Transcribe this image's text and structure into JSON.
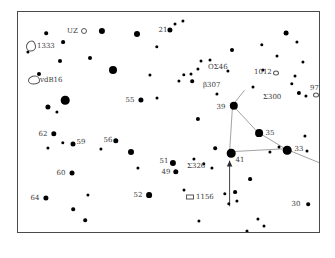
{
  "chart_data": {
    "type": "scatter",
    "title": "",
    "subtitle": "",
    "xlabel": "",
    "ylabel": "",
    "grid": false,
    "legend": "none",
    "field": {
      "x": 17,
      "y": 11,
      "width": 303,
      "height": 222
    },
    "xlim": [
      0,
      303
    ],
    "ylim": [
      0,
      222
    ],
    "stars": [
      {
        "x": 10,
        "y": 40,
        "r": 1.6
      },
      {
        "x": 28,
        "y": 21,
        "r": 1.8
      },
      {
        "x": 45,
        "y": 30,
        "r": 1.9
      },
      {
        "x": 42,
        "y": 49,
        "r": 2.0
      },
      {
        "x": 84,
        "y": 19,
        "r": 3.1
      },
      {
        "x": 21,
        "y": 62,
        "r": 2.0
      },
      {
        "x": 72,
        "y": 46,
        "r": 2.0
      },
      {
        "x": 95,
        "y": 58,
        "r": 4.0
      },
      {
        "x": 119,
        "y": 22,
        "r": 3.0
      },
      {
        "x": 132,
        "y": 63,
        "r": 1.6
      },
      {
        "x": 139,
        "y": 35,
        "r": 1.7
      },
      {
        "x": 152,
        "y": 18,
        "r": 2.6
      },
      {
        "x": 157,
        "y": 12,
        "r": 1.5
      },
      {
        "x": 165,
        "y": 9,
        "r": 1.6
      },
      {
        "x": 47,
        "y": 88,
        "r": 4.3
      },
      {
        "x": 30,
        "y": 95,
        "r": 2.6
      },
      {
        "x": 39,
        "y": 100,
        "r": 1.6
      },
      {
        "x": 123,
        "y": 88,
        "r": 2.6
      },
      {
        "x": 139,
        "y": 86,
        "r": 1.5
      },
      {
        "x": 36,
        "y": 122,
        "r": 2.7
      },
      {
        "x": 55,
        "y": 132,
        "r": 2.5
      },
      {
        "x": 30,
        "y": 136,
        "r": 1.6
      },
      {
        "x": 45,
        "y": 131,
        "r": 1.7
      },
      {
        "x": 83,
        "y": 137,
        "r": 1.6
      },
      {
        "x": 98,
        "y": 129,
        "r": 2.7
      },
      {
        "x": 113,
        "y": 140,
        "r": 3.0
      },
      {
        "x": 120,
        "y": 156,
        "r": 1.6
      },
      {
        "x": 54,
        "y": 161,
        "r": 2.5
      },
      {
        "x": 28,
        "y": 186,
        "r": 2.6
      },
      {
        "x": 70,
        "y": 183,
        "r": 1.6
      },
      {
        "x": 55,
        "y": 197,
        "r": 1.8
      },
      {
        "x": 67,
        "y": 208,
        "r": 1.8
      },
      {
        "x": 56,
        "y": 224,
        "r": 1.9
      },
      {
        "x": 124,
        "y": 226,
        "r": 1.5
      },
      {
        "x": 131,
        "y": 183,
        "r": 2.9
      },
      {
        "x": 155,
        "y": 151,
        "r": 3.1
      },
      {
        "x": 158,
        "y": 160,
        "r": 2.7
      },
      {
        "x": 166,
        "y": 178,
        "r": 1.5
      },
      {
        "x": 180,
        "y": 107,
        "r": 2.1
      },
      {
        "x": 176,
        "y": 147,
        "r": 1.6
      },
      {
        "x": 186,
        "y": 152,
        "r": 1.7
      },
      {
        "x": 194,
        "y": 156,
        "r": 1.6
      },
      {
        "x": 161,
        "y": 69,
        "r": 1.6
      },
      {
        "x": 166,
        "y": 63,
        "r": 1.7
      },
      {
        "x": 173,
        "y": 62,
        "r": 1.5
      },
      {
        "x": 180,
        "y": 57,
        "r": 1.6
      },
      {
        "x": 174,
        "y": 69,
        "r": 1.8
      },
      {
        "x": 183,
        "y": 49,
        "r": 1.5
      },
      {
        "x": 192,
        "y": 48,
        "r": 1.5
      },
      {
        "x": 199,
        "y": 82,
        "r": 1.6
      },
      {
        "x": 210,
        "y": 59,
        "r": 1.6
      },
      {
        "x": 214,
        "y": 38,
        "r": 2.0
      },
      {
        "x": 235,
        "y": 75,
        "r": 1.5
      },
      {
        "x": 245,
        "y": 58,
        "r": 1.6
      },
      {
        "x": 244,
        "y": 33,
        "r": 1.7
      },
      {
        "x": 259,
        "y": 44,
        "r": 1.5
      },
      {
        "x": 268,
        "y": 21,
        "r": 2.4
      },
      {
        "x": 279,
        "y": 30,
        "r": 1.6
      },
      {
        "x": 285,
        "y": 50,
        "r": 1.6
      },
      {
        "x": 274,
        "y": 72,
        "r": 1.7
      },
      {
        "x": 281,
        "y": 81,
        "r": 2.1
      },
      {
        "x": 288,
        "y": 84,
        "r": 1.6
      },
      {
        "x": 277,
        "y": 64,
        "r": 1.5
      },
      {
        "x": 216,
        "y": 94,
        "r": 4.2
      },
      {
        "x": 241,
        "y": 121,
        "r": 3.9
      },
      {
        "x": 261,
        "y": 135,
        "r": 1.5
      },
      {
        "x": 252,
        "y": 140,
        "r": 1.6
      },
      {
        "x": 269,
        "y": 138,
        "r": 4.3
      },
      {
        "x": 213,
        "y": 141,
        "r": 4.3
      },
      {
        "x": 197,
        "y": 136,
        "r": 1.8
      },
      {
        "x": 287,
        "y": 124,
        "r": 1.6
      },
      {
        "x": 289,
        "y": 139,
        "r": 1.5
      },
      {
        "x": 232,
        "y": 167,
        "r": 1.9
      },
      {
        "x": 207,
        "y": 182,
        "r": 1.7
      },
      {
        "x": 217,
        "y": 180,
        "r": 1.9
      },
      {
        "x": 219,
        "y": 189,
        "r": 1.6
      },
      {
        "x": 211,
        "y": 192,
        "r": 1.7
      },
      {
        "x": 290,
        "y": 192,
        "r": 1.8
      },
      {
        "x": 240,
        "y": 207,
        "r": 1.6
      },
      {
        "x": 181,
        "y": 209,
        "r": 1.6
      },
      {
        "x": 229,
        "y": 219,
        "r": 1.5
      },
      {
        "x": 246,
        "y": 214,
        "r": 1.5
      }
    ],
    "star_labels": [
      {
        "text": "21",
        "x": 145,
        "y": 18
      },
      {
        "text": "55",
        "x": 112,
        "y": 88
      },
      {
        "text": "62",
        "x": 25,
        "y": 122
      },
      {
        "text": "59",
        "x": 63,
        "y": 130
      },
      {
        "text": "56",
        "x": 90,
        "y": 128
      },
      {
        "text": "51",
        "x": 146,
        "y": 149
      },
      {
        "text": "49",
        "x": 148,
        "y": 160
      },
      {
        "text": "60",
        "x": 43,
        "y": 161
      },
      {
        "text": "52",
        "x": 120,
        "y": 183
      },
      {
        "text": "64",
        "x": 17,
        "y": 186
      },
      {
        "text": "39",
        "x": 203,
        "y": 95
      },
      {
        "text": "41",
        "x": 222,
        "y": 148
      },
      {
        "text": "35",
        "x": 252,
        "y": 121
      },
      {
        "text": "33",
        "x": 281,
        "y": 137
      },
      {
        "text": "30",
        "x": 278,
        "y": 192
      }
    ],
    "object_labels": [
      {
        "text": "UZ",
        "x": 49,
        "y": 19
      },
      {
        "text": "1333",
        "x": 19,
        "y": 34
      },
      {
        "text": "vdB16",
        "x": 22,
        "y": 68
      },
      {
        "text": "Σ375",
        "x": 62,
        "y": 224
      },
      {
        "text": "Σ326",
        "x": 169,
        "y": 154
      },
      {
        "text": "1156",
        "x": 178,
        "y": 185
      },
      {
        "text": "OΣ46",
        "x": 190,
        "y": 55
      },
      {
        "text": "1012",
        "x": 236,
        "y": 60
      },
      {
        "text": "β307",
        "x": 185,
        "y": 73
      },
      {
        "text": "Σ300",
        "x": 245,
        "y": 85
      },
      {
        "text": "972",
        "x": 292,
        "y": 76
      }
    ],
    "symbols": [
      {
        "kind": "open-circle",
        "x": 66,
        "y": 19,
        "w": 4,
        "h": 4
      },
      {
        "kind": "nebula",
        "x": 13,
        "y": 34,
        "w": 8,
        "h": 9
      },
      {
        "kind": "nebula",
        "x": 16,
        "y": 68,
        "w": 10,
        "h": 7
      },
      {
        "kind": "open-circle",
        "x": 258,
        "y": 61,
        "w": 4,
        "h": 3
      },
      {
        "kind": "open-circle",
        "x": 298,
        "y": 83,
        "w": 4,
        "h": 3
      },
      {
        "kind": "open-rect",
        "x": 172,
        "y": 185,
        "w": 6,
        "h": 3
      }
    ],
    "constellation_lines": [
      {
        "x1": 216,
        "y1": 94,
        "x2": 213,
        "y2": 141
      },
      {
        "x1": 216,
        "y1": 94,
        "x2": 241,
        "y2": 121
      },
      {
        "x1": 241,
        "y1": 121,
        "x2": 269,
        "y2": 138
      },
      {
        "x1": 213,
        "y1": 141,
        "x2": 269,
        "y2": 138
      },
      {
        "x1": 269,
        "y1": 138,
        "x2": 303,
        "y2": 152
      },
      {
        "x1": 216,
        "y1": 94,
        "x2": 228,
        "y2": 79
      }
    ],
    "arrow": {
      "x1": 213,
      "y1": 196,
      "x2": 213,
      "y2": 150
    },
    "scale_bar": {
      "x1": 184,
      "x2": 280,
      "y": 226,
      "ticks": [
        184,
        216,
        248,
        280
      ],
      "label": ""
    }
  }
}
